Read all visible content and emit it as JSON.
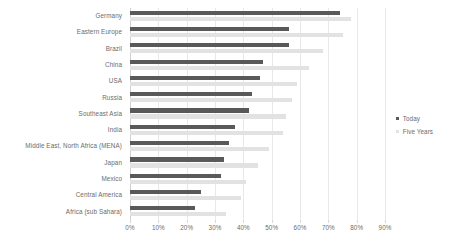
{
  "chart_data": {
    "type": "bar",
    "orientation": "horizontal",
    "title": "",
    "subtitle": "",
    "xlabel": "",
    "ylabel": "",
    "xlim": [
      0,
      90
    ],
    "xticks": [
      0,
      10,
      20,
      30,
      40,
      50,
      60,
      70,
      80,
      90
    ],
    "xticklabels": [
      "0%",
      "10%",
      "20%",
      "30%",
      "40%",
      "50%",
      "60%",
      "70%",
      "80%",
      "90%"
    ],
    "grid": true,
    "grid_axis": "x",
    "legend_position": "right",
    "units": "%",
    "categories": [
      "Germany",
      "Eastern Europe",
      "Brazil",
      "China",
      "USA",
      "Russia",
      "Southeast Asia",
      "India",
      "Middle East, North Africa (MENA)",
      "Japan",
      "Mexico",
      "Central America",
      "Africa (sub Sahara)"
    ],
    "series": [
      {
        "name": "Today",
        "color": "#595959",
        "values": [
          74,
          56,
          56,
          47,
          46,
          43,
          42,
          37,
          35,
          33,
          32,
          25,
          23
        ]
      },
      {
        "name": "Five Years",
        "color": "#e2e2e2",
        "values": [
          78,
          75,
          68,
          63,
          59,
          57,
          55,
          54,
          49,
          45,
          41,
          39,
          34
        ]
      }
    ]
  },
  "legend": {
    "items": [
      {
        "label": "Today",
        "color": "#595959"
      },
      {
        "label": "Five Years",
        "color": "#e2e2e2"
      }
    ]
  },
  "colors": {
    "today": "#595959",
    "five_years": "#e2e2e2",
    "gridline": "#e8e8e8",
    "text": "#6b6b6b",
    "background": "#ffffff"
  }
}
